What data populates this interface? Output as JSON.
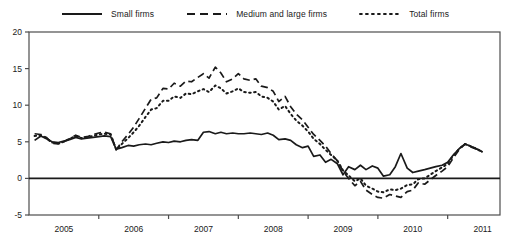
{
  "legend": {
    "position": "top-center",
    "items": [
      {
        "label": "Small firms",
        "style": "solid",
        "key": "small"
      },
      {
        "label": "Medium and large firms",
        "style": "dashed",
        "key": "medium_large"
      },
      {
        "label": "Total firms",
        "style": "dotted",
        "key": "total"
      }
    ]
  },
  "colors": {
    "line": "#1a1a1a",
    "axis": "#4d4d4d",
    "zero_line": "#1a1a1a",
    "background": "#ffffff"
  },
  "chart_data": {
    "type": "line",
    "title": "",
    "subtitle": "",
    "xlabel": "",
    "ylabel": "",
    "xlim": [
      2004.5,
      2011.25
    ],
    "ylim": [
      -5,
      20
    ],
    "ytick_values": [
      20,
      15,
      10,
      5,
      0,
      -5
    ],
    "ytick_labels": [
      "20",
      "15",
      "10",
      "5",
      "0",
      "-5"
    ],
    "xtick_values": [
      2005,
      2006,
      2007,
      2008,
      2009,
      2010,
      2011
    ],
    "xtick_labels": [
      "2005",
      "2006",
      "2007",
      "2008",
      "2009",
      "2010",
      "2011"
    ],
    "grid": false,
    "zero_line": 0,
    "series": [
      {
        "name": "Small firms",
        "style": "solid",
        "x": [
          2004.58,
          2004.67,
          2004.75,
          2004.83,
          2004.92,
          2005.0,
          2005.08,
          2005.17,
          2005.25,
          2005.33,
          2005.42,
          2005.5,
          2005.58,
          2005.67,
          2005.75,
          2005.83,
          2005.92,
          2006.0,
          2006.08,
          2006.17,
          2006.25,
          2006.33,
          2006.42,
          2006.5,
          2006.58,
          2006.67,
          2006.75,
          2006.83,
          2006.92,
          2007.0,
          2007.08,
          2007.17,
          2007.25,
          2007.33,
          2007.42,
          2007.5,
          2007.58,
          2007.67,
          2007.75,
          2007.83,
          2007.92,
          2008.0,
          2008.08,
          2008.17,
          2008.25,
          2008.33,
          2008.42,
          2008.5,
          2008.58,
          2008.67,
          2008.75,
          2008.83,
          2008.92,
          2009.0,
          2009.08,
          2009.17,
          2009.25,
          2009.33,
          2009.42,
          2009.5,
          2009.58,
          2009.67,
          2009.75,
          2009.83,
          2009.92,
          2010.0,
          2010.08,
          2010.17,
          2010.25,
          2010.33,
          2010.42,
          2010.5,
          2010.58,
          2010.67,
          2010.75,
          2010.83,
          2010.92,
          2011.0
        ],
        "y": [
          5.2,
          5.8,
          5.4,
          5.0,
          4.9,
          5.1,
          5.3,
          5.6,
          5.4,
          5.5,
          5.6,
          5.7,
          5.8,
          5.7,
          4.0,
          4.2,
          4.5,
          4.4,
          4.6,
          4.7,
          4.6,
          4.8,
          5.0,
          4.9,
          5.1,
          5.0,
          5.2,
          5.3,
          5.2,
          6.3,
          6.4,
          6.1,
          6.3,
          6.1,
          6.2,
          6.1,
          6.1,
          6.2,
          6.1,
          6.0,
          6.2,
          5.9,
          5.3,
          5.4,
          5.2,
          4.6,
          4.2,
          4.4,
          3.0,
          3.2,
          2.2,
          2.6,
          2.0,
          0.5,
          1.6,
          1.2,
          1.8,
          1.2,
          1.7,
          1.4,
          0.3,
          0.5,
          1.6,
          3.4,
          1.4,
          0.8,
          1.0,
          1.2,
          1.4,
          1.6,
          1.8,
          2.2,
          3.2,
          4.1,
          4.7,
          4.4,
          4.0,
          3.6
        ]
      },
      {
        "name": "Medium and large firms",
        "style": "dashed",
        "x": [
          2004.58,
          2004.67,
          2004.75,
          2004.83,
          2004.92,
          2005.0,
          2005.08,
          2005.17,
          2005.25,
          2005.33,
          2005.42,
          2005.5,
          2005.58,
          2005.67,
          2005.75,
          2005.83,
          2005.92,
          2006.0,
          2006.08,
          2006.17,
          2006.25,
          2006.33,
          2006.42,
          2006.5,
          2006.58,
          2006.67,
          2006.75,
          2006.83,
          2006.92,
          2007.0,
          2007.08,
          2007.17,
          2007.25,
          2007.33,
          2007.42,
          2007.5,
          2007.58,
          2007.67,
          2007.75,
          2007.83,
          2007.92,
          2008.0,
          2008.08,
          2008.17,
          2008.25,
          2008.33,
          2008.42,
          2008.5,
          2008.58,
          2008.67,
          2008.75,
          2008.83,
          2008.92,
          2009.0,
          2009.08,
          2009.17,
          2009.25,
          2009.33,
          2009.42,
          2009.5,
          2009.58,
          2009.67,
          2009.75,
          2009.83,
          2009.92,
          2010.0,
          2010.08,
          2010.17,
          2010.25,
          2010.33,
          2010.42,
          2010.5,
          2010.58,
          2010.67,
          2010.75,
          2010.83,
          2010.92,
          2011.0
        ],
        "y": [
          6.1,
          6.0,
          5.6,
          4.8,
          4.7,
          5.0,
          5.4,
          5.9,
          5.6,
          5.7,
          6.0,
          6.2,
          6.3,
          6.1,
          3.9,
          5.0,
          6.0,
          7.0,
          8.2,
          9.6,
          10.8,
          11.0,
          12.3,
          12.2,
          13.0,
          12.6,
          13.3,
          13.2,
          13.8,
          14.3,
          13.7,
          15.2,
          14.4,
          13.2,
          13.6,
          14.3,
          13.6,
          13.4,
          13.6,
          12.6,
          12.4,
          11.9,
          10.5,
          11.2,
          9.8,
          8.8,
          8.0,
          7.0,
          6.0,
          5.2,
          4.4,
          3.4,
          2.4,
          1.0,
          0.0,
          -1.0,
          -0.4,
          -1.6,
          -2.2,
          -2.6,
          -2.7,
          -2.2,
          -2.4,
          -2.6,
          -1.8,
          -1.6,
          -0.6,
          -0.8,
          -0.2,
          0.4,
          1.0,
          1.6,
          2.8,
          4.0,
          4.7,
          4.3,
          4.0,
          3.6
        ]
      },
      {
        "name": "Total firms",
        "style": "dotted",
        "x": [
          2004.58,
          2004.67,
          2004.75,
          2004.83,
          2004.92,
          2005.0,
          2005.08,
          2005.17,
          2005.25,
          2005.33,
          2005.42,
          2005.5,
          2005.58,
          2005.67,
          2005.75,
          2005.83,
          2005.92,
          2006.0,
          2006.08,
          2006.17,
          2006.25,
          2006.33,
          2006.42,
          2006.5,
          2006.58,
          2006.67,
          2006.75,
          2006.83,
          2006.92,
          2007.0,
          2007.08,
          2007.17,
          2007.25,
          2007.33,
          2007.42,
          2007.5,
          2007.58,
          2007.67,
          2007.75,
          2007.83,
          2007.92,
          2008.0,
          2008.08,
          2008.17,
          2008.25,
          2008.33,
          2008.42,
          2008.5,
          2008.58,
          2008.67,
          2008.75,
          2008.83,
          2008.92,
          2009.0,
          2009.08,
          2009.17,
          2009.25,
          2009.33,
          2009.42,
          2009.5,
          2009.58,
          2009.67,
          2009.75,
          2009.83,
          2009.92,
          2010.0,
          2010.08,
          2010.17,
          2010.25,
          2010.33,
          2010.42,
          2010.5,
          2010.58,
          2010.67,
          2010.75,
          2010.83,
          2010.92,
          2011.0
        ],
        "y": [
          5.8,
          5.9,
          5.5,
          4.9,
          4.8,
          5.0,
          5.4,
          5.8,
          5.5,
          5.6,
          5.8,
          6.0,
          6.1,
          6.0,
          3.9,
          4.7,
          5.5,
          6.3,
          7.2,
          8.4,
          9.4,
          9.6,
          10.6,
          10.6,
          11.2,
          11.0,
          11.6,
          11.5,
          11.9,
          12.2,
          11.8,
          12.7,
          12.3,
          11.6,
          11.9,
          12.3,
          11.8,
          11.7,
          11.8,
          11.2,
          11.0,
          10.5,
          9.4,
          9.9,
          8.8,
          7.9,
          7.2,
          6.4,
          5.4,
          4.7,
          3.9,
          3.2,
          2.4,
          1.1,
          0.4,
          -0.4,
          0.0,
          -1.0,
          -1.4,
          -1.8,
          -1.9,
          -1.5,
          -1.6,
          -1.4,
          -0.9,
          -0.8,
          -0.1,
          0.0,
          0.5,
          1.0,
          1.5,
          2.0,
          3.1,
          4.1,
          4.7,
          4.4,
          4.0,
          3.6
        ]
      }
    ]
  }
}
